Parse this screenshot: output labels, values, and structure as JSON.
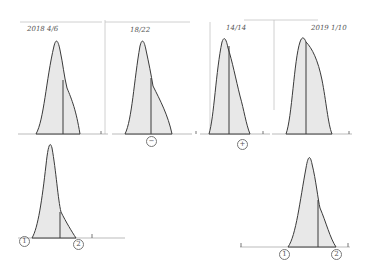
{
  "sketch": {
    "description": "Hand-drawn pencil sketch of skewed bell-shaped distribution curves with a vertical marker line",
    "stroke_color": "#3a3a3a",
    "fill_color": "#e6e6e6",
    "frame_color": "#b8b8b8"
  },
  "top_row": [
    {
      "label": "2018 4/6",
      "marker": ""
    },
    {
      "label": "18/22",
      "marker": "−"
    },
    {
      "label": "14/14",
      "marker": "+"
    },
    {
      "label": "2019 1/10",
      "marker": ""
    }
  ],
  "bottom_row": [
    {
      "left_marker": "1",
      "right_marker": "2"
    },
    {
      "left_marker": "1",
      "right_marker": "2"
    }
  ],
  "corner_marker": "+"
}
